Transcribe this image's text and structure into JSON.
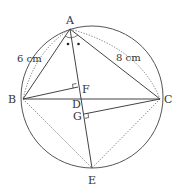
{
  "figure": {
    "points": {
      "A": {
        "label": "A"
      },
      "B": {
        "label": "B"
      },
      "C": {
        "label": "C"
      },
      "D": {
        "label": "D"
      },
      "E": {
        "label": "E"
      },
      "F": {
        "label": "F"
      },
      "G": {
        "label": "G"
      }
    },
    "measurements": {
      "AB": "6 cm",
      "AC": "8 cm"
    },
    "segments_solid": [
      "AB",
      "AC",
      "BC",
      "AE",
      "BF",
      "CG"
    ],
    "segments_dotted": [
      "AB-arc",
      "AC-arc",
      "BE",
      "CE"
    ],
    "right_angles": [
      "F",
      "G"
    ],
    "equal_angle_marks": "two dots at A (angle BAE = angle EAC)",
    "colors": {
      "stroke": "#444444",
      "text": "#333333",
      "background": "#ffffff"
    }
  }
}
